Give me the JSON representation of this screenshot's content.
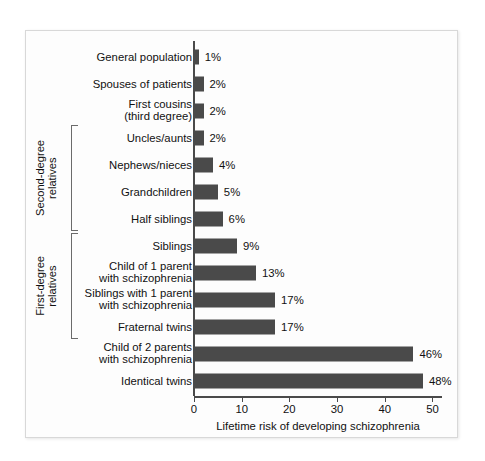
{
  "figure": {
    "frame_color": "#d8d8d8",
    "background": "#fdfdfd",
    "bar_color": "#4a4a4a",
    "axis_color": "#4a4a4a"
  },
  "groups": [
    {
      "name": "second-degree-relatives",
      "label": "Second-degree\nrelatives",
      "first_index": 3,
      "last_index": 6
    },
    {
      "name": "first-degree-relatives",
      "label": "First-degree\nrelatives",
      "first_index": 7,
      "last_index": 10
    }
  ],
  "chart_data": {
    "type": "bar",
    "orientation": "horizontal",
    "title": "",
    "xlabel": "Lifetime risk of developing schizophrenia",
    "ylabel": "",
    "xlim": [
      0,
      52
    ],
    "xticks": [
      0,
      10,
      20,
      30,
      40,
      50
    ],
    "xtick_labels": [
      "0",
      "10",
      "20",
      "30",
      "40",
      "50"
    ],
    "grid": false,
    "legend": false,
    "categories": [
      "General population",
      "Spouses of patients",
      "First cousins\n(third degree)",
      "Uncles/aunts",
      "Nephews/nieces",
      "Grandchildren",
      "Half siblings",
      "Siblings",
      "Child of 1 parent\nwith schizophrenia",
      "Siblings with 1 parent\nwith schizophrenia",
      "Fraternal twins",
      "Child of 2 parents\nwith schizophrenia",
      "Identical twins"
    ],
    "values": [
      1,
      2,
      2,
      2,
      4,
      5,
      6,
      9,
      13,
      17,
      17,
      46,
      48
    ],
    "value_labels": [
      "1%",
      "2%",
      "2%",
      "2%",
      "4%",
      "5%",
      "6%",
      "9%",
      "13%",
      "17%",
      "17%",
      "46%",
      "48%"
    ]
  }
}
